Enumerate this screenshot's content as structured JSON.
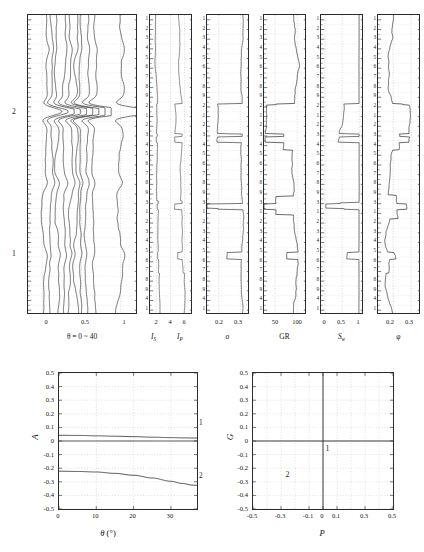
{
  "figure": {
    "background_color": "#ffffff",
    "line_color": "#1a1a1a",
    "grid_color": "#b9b9b9"
  },
  "depth_axis": {
    "tick_labels": [
      "1",
      "2",
      "3",
      "4",
      "5",
      "6",
      "7",
      "8",
      "9",
      "2",
      "1",
      "2",
      "3",
      "4",
      "5",
      "6",
      "7",
      "8",
      "9",
      "3",
      "1",
      "2",
      "3",
      "4",
      "5",
      "6",
      "7",
      "8",
      "9",
      "4",
      "1"
    ],
    "major_marks": [
      "2",
      "1"
    ],
    "left_marker_labels": [
      {
        "label": "2",
        "position_frac": 0.322
      },
      {
        "label": "1",
        "position_frac": 0.795
      }
    ]
  },
  "tracks": [
    {
      "id": "gather",
      "name": "angle-gather-track",
      "caption": "θ = 0 ~ 40",
      "caption_plain": "theta = 0 ~ 40",
      "xlim": [
        -0.18,
        1.22
      ],
      "x_ticks": [
        {
          "value": 0,
          "label": "0"
        },
        {
          "value": 0.5,
          "label": "0.5"
        },
        {
          "value": 1,
          "label": "1"
        }
      ],
      "trace_count": 10,
      "show_depth_labels": false,
      "grid_x": [
        0,
        0.5,
        1
      ]
    },
    {
      "id": "impedance",
      "name": "impedance-track",
      "caption": "I_S        I_P",
      "curves": [
        {
          "name": "I_S",
          "symbol": "I",
          "subscript": "S"
        },
        {
          "name": "I_P",
          "symbol": "I",
          "subscript": "P"
        }
      ],
      "xlim": [
        1.1,
        7.2
      ],
      "x_ticks": [
        {
          "value": 2,
          "label": "2"
        },
        {
          "value": 4,
          "label": "4"
        },
        {
          "value": 6,
          "label": "6"
        }
      ],
      "show_depth_labels": true
    },
    {
      "id": "sigma",
      "name": "poisson-ratio-track",
      "caption": "σ",
      "caption_plain": "sigma",
      "xlim": [
        0.145,
        0.345
      ],
      "x_ticks": [
        {
          "value": 0.2,
          "label": "0.2"
        },
        {
          "value": 0.3,
          "label": "0.3"
        }
      ],
      "show_depth_labels": true
    },
    {
      "id": "gr",
      "name": "gamma-ray-track",
      "caption": "GR",
      "xlim": [
        25,
        122
      ],
      "x_ticks": [
        {
          "value": 50,
          "label": "50"
        },
        {
          "value": 100,
          "label": "100"
        }
      ],
      "show_depth_labels": true
    },
    {
      "id": "sw",
      "name": "water-saturation-track",
      "caption": "S_w",
      "caption_symbol": "S",
      "caption_sub": "w",
      "xlim": [
        -0.12,
        1.14
      ],
      "x_ticks": [
        {
          "value": 0,
          "label": "0"
        },
        {
          "value": 0.5,
          "label": "0.5"
        },
        {
          "value": 1,
          "label": "1"
        }
      ],
      "show_depth_labels": true
    },
    {
      "id": "phi",
      "name": "porosity-track",
      "caption": "φ",
      "caption_plain": "phi",
      "xlim": [
        0.115,
        0.355
      ],
      "x_ticks": [
        {
          "value": 0.2,
          "label": "0.2"
        },
        {
          "value": 0.3,
          "label": "0.3"
        }
      ],
      "show_depth_labels": true
    }
  ],
  "chart_data": [
    {
      "type": "line",
      "id": "avo-amplitude",
      "name": "avo-amplitude-chart",
      "title": "",
      "xlabel": "θ (°)",
      "xlabel_symbol": "θ",
      "xlabel_unit": "(°)",
      "ylabel": "A",
      "xlim": [
        0,
        37
      ],
      "ylim": [
        -0.5,
        0.5
      ],
      "x_ticks": [
        0,
        10,
        20,
        30
      ],
      "x_tick_labels": [
        "0",
        "10",
        "20",
        "30"
      ],
      "y_ticks": [
        -0.5,
        -0.4,
        -0.3,
        -0.2,
        -0.1,
        0,
        0.1,
        0.2,
        0.3,
        0.4,
        0.5
      ],
      "y_tick_labels": [
        "-0.5",
        "-0.4",
        "-0.3",
        "-0.2",
        "-0.1",
        "0",
        "0.1",
        "0.2",
        "0.3",
        "0.4",
        "0.5"
      ],
      "grid": true,
      "series": [
        {
          "name": "1",
          "label": "1",
          "x": [
            0,
            5,
            10,
            15,
            20,
            25,
            30,
            33,
            36
          ],
          "y": [
            0.042,
            0.041,
            0.038,
            0.035,
            0.032,
            0.028,
            0.025,
            0.023,
            0.022
          ]
        },
        {
          "name": "2",
          "label": "2",
          "x": [
            0,
            5,
            10,
            15,
            20,
            25,
            30,
            33,
            36
          ],
          "y": [
            -0.222,
            -0.224,
            -0.228,
            -0.238,
            -0.252,
            -0.272,
            -0.296,
            -0.312,
            -0.325
          ]
        },
        {
          "name": "zero-line",
          "label": "",
          "x": [
            0,
            36
          ],
          "y": [
            0,
            0
          ]
        }
      ]
    },
    {
      "type": "scatter",
      "id": "avo-pg-crossplot",
      "name": "intercept-gradient-crossplot",
      "title": "",
      "xlabel": "P",
      "ylabel": "G",
      "xlim": [
        -0.5,
        0.5
      ],
      "ylim": [
        -0.5,
        0.5
      ],
      "x_ticks": [
        -0.5,
        -0.3,
        -0.1,
        0,
        0.1,
        0.3,
        0.5
      ],
      "x_tick_labels": [
        "-0.5",
        "-0.3",
        "-0.1",
        "0",
        "0.1",
        "0.3",
        "0.5"
      ],
      "y_ticks": [
        -0.5,
        -0.4,
        -0.3,
        -0.2,
        -0.1,
        0,
        0.1,
        0.2,
        0.3,
        0.4,
        0.5
      ],
      "y_tick_labels": [
        "-0.5",
        "-0.4",
        "-0.3",
        "-0.2",
        "-0.1",
        "0",
        "0.1",
        "0.2",
        "0.3",
        "0.4",
        "0.5"
      ],
      "grid": true,
      "grid_x": [
        -0.4,
        -0.3,
        -0.2,
        -0.1,
        0.1,
        0.2,
        0.3,
        0.4
      ],
      "axis_lines": {
        "x_zero": 0,
        "y_zero": 0
      },
      "annotations": [
        {
          "label": "1",
          "x": 0.025,
          "y": -0.065
        },
        {
          "label": "2",
          "x": -0.26,
          "y": -0.255
        }
      ]
    }
  ]
}
